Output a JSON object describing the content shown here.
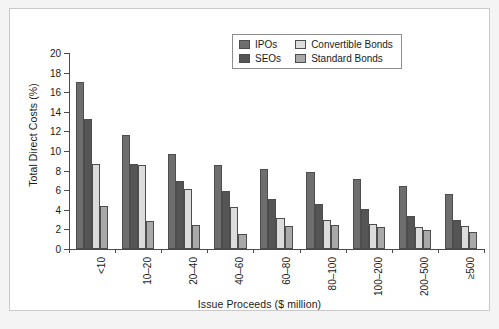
{
  "chart_data": {
    "type": "bar",
    "title": "",
    "xlabel": "Issue Proceeds ($ million)",
    "ylabel": "Total Direct Costs (%)",
    "ylim": [
      0,
      20
    ],
    "yticks": [
      0,
      2,
      4,
      6,
      8,
      10,
      12,
      14,
      16,
      18,
      20
    ],
    "ytick_labels": [
      "0",
      "2",
      "4",
      "6",
      "8",
      "10",
      "12",
      "14",
      "16",
      "18",
      "20"
    ],
    "grid": false,
    "legend_position": "top-right",
    "xtick_rotation": 90,
    "categories": [
      "<10",
      "10–20",
      "20–40",
      "40–60",
      "60–80",
      "80–100",
      "100–200",
      "200–500",
      "≥500"
    ],
    "series": [
      {
        "name": "IPOs",
        "color": "#6e6e6e",
        "values": [
          17.0,
          11.6,
          9.7,
          8.6,
          8.2,
          7.9,
          7.1,
          6.4,
          5.6
        ]
      },
      {
        "name": "SEOs",
        "color": "#555555",
        "values": [
          13.3,
          8.7,
          6.9,
          5.9,
          5.1,
          4.6,
          4.1,
          3.4,
          3.0
        ]
      },
      {
        "name": "Convertible Bonds",
        "color": "#dcdcdc",
        "values": [
          8.7,
          8.6,
          6.1,
          4.3,
          3.2,
          3.0,
          2.6,
          2.2,
          2.3
        ]
      },
      {
        "name": "Standard Bonds",
        "color": "#a9a9a9",
        "values": [
          4.4,
          2.9,
          2.5,
          1.5,
          2.3,
          2.4,
          2.2,
          1.9,
          1.7
        ]
      }
    ]
  }
}
